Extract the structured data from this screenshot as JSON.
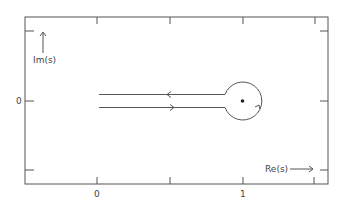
{
  "diagram": {
    "colors": {
      "line": "#555555",
      "text": "#444444",
      "background": "#ffffff",
      "point": "#222222"
    },
    "axes": {
      "x_label": "Re(s)",
      "y_label": "Im(s)",
      "x_tick_labels": [
        {
          "value": "0",
          "x": 97
        },
        {
          "value": "1",
          "x": 243
        }
      ],
      "y_tick_labels": [
        {
          "value": "0",
          "y": 101
        }
      ],
      "x_ticks_px": [
        97,
        170,
        243,
        315
      ],
      "y_ticks_px": [
        31,
        101,
        170
      ]
    },
    "contour": {
      "pole": {
        "re": 1,
        "im": 0
      },
      "circle_radius_px": 19,
      "upper_branch_direction": "leftward",
      "lower_branch_direction": "rightward",
      "circle_direction": "counterclockwise"
    }
  }
}
